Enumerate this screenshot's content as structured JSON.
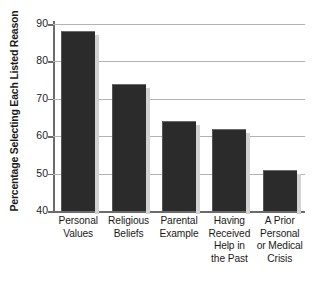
{
  "chart_data": {
    "type": "bar",
    "title": "",
    "subtitle": "",
    "xlabel": "",
    "ylabel": "Percentage Selecting Each Listed Reason",
    "ylim": [
      40,
      90
    ],
    "yticks": [
      40,
      50,
      60,
      70,
      80,
      90
    ],
    "ytick_labels": [
      "40",
      "50",
      "60",
      "70",
      "80",
      "90"
    ],
    "grid": "horizontal",
    "legend": "none",
    "categories": [
      "Personal Values",
      "Religious Beliefs",
      "Parental Example",
      "Having Received Help in the Past",
      "A Prior Personal or Medical Crisis"
    ],
    "category_lines": [
      [
        "Personal",
        "Values"
      ],
      [
        "Religious",
        "Beliefs"
      ],
      [
        "Parental",
        "Example"
      ],
      [
        "Having",
        "Received",
        "Help in",
        "the Past"
      ],
      [
        "A Prior",
        "Personal",
        "or Medical",
        "Crisis"
      ]
    ],
    "values": [
      88,
      74,
      64,
      62,
      51
    ],
    "bar_color": "#2b2b2b",
    "gridline_color": "#b3b3b3",
    "axis_color": "#6b6b6b",
    "background_color": "#ffffff"
  }
}
